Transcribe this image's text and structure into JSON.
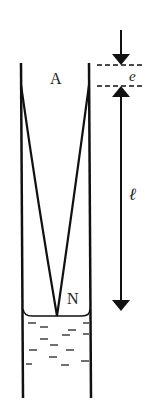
{
  "diagram": {
    "type": "physics-resonance-tube",
    "labels": {
      "top_point": "A",
      "node_point": "N",
      "end_correction": "e",
      "length": "ℓ"
    },
    "colors": {
      "line": "#111111",
      "background": "#ffffff",
      "water_dash": "#333333"
    }
  }
}
